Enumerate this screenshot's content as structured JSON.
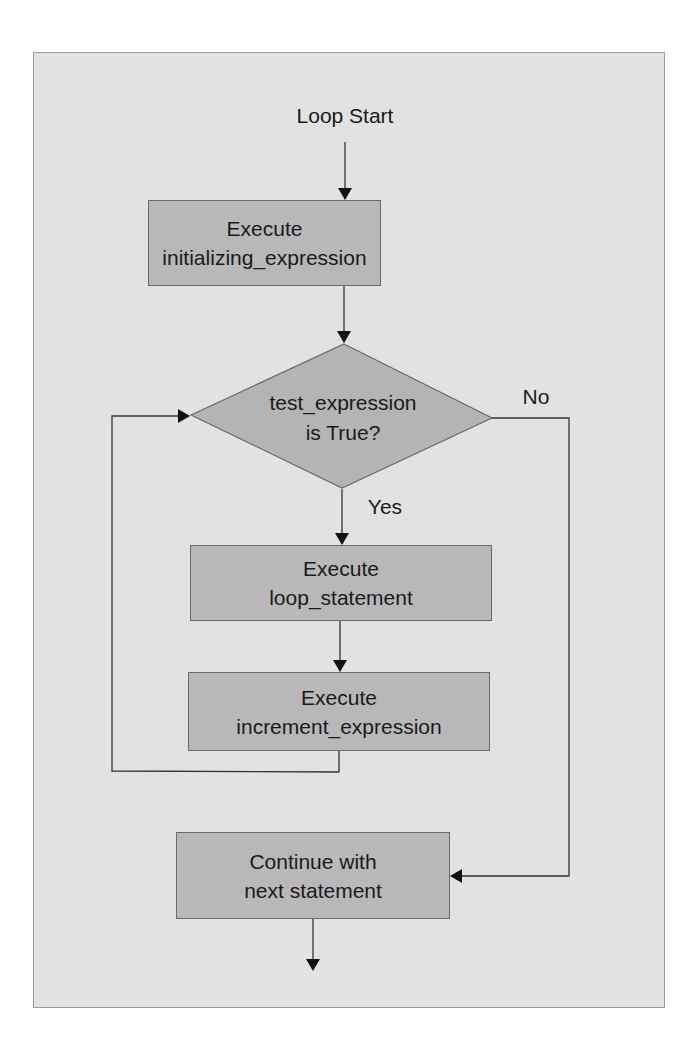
{
  "diagram": {
    "type": "flowchart",
    "start": {
      "label": "Loop Start"
    },
    "nodes": {
      "init": {
        "line1": "Execute",
        "line2": "initializing_expression"
      },
      "decision": {
        "line1": "test_expression",
        "line2": "is True?"
      },
      "body": {
        "line1": "Execute",
        "line2": "loop_statement"
      },
      "increment": {
        "line1": "Execute",
        "line2": "increment_expression"
      },
      "end": {
        "line1": "Continue with",
        "line2": "next statement"
      }
    },
    "edges": {
      "yes_label": "Yes",
      "no_label": "No"
    },
    "colors": {
      "panel_bg": "#e2e2e2",
      "node_fill": "#b8b8b8",
      "line": "#333333"
    }
  }
}
